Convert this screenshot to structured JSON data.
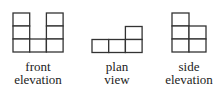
{
  "views": [
    {
      "id": "front",
      "label_line1": "front",
      "label_line2": "elevation",
      "grid": {
        "origin": [
          13,
          13
        ],
        "cell_w": 16.7,
        "cell_h": 13,
        "cells": [
          [
            0,
            0
          ],
          [
            2,
            0
          ],
          [
            0,
            1
          ],
          [
            2,
            1
          ],
          [
            0,
            2
          ],
          [
            1,
            2
          ],
          [
            2,
            2
          ]
        ]
      }
    },
    {
      "id": "plan",
      "label_line1": "plan",
      "label_line2": "view",
      "grid": {
        "origin": [
          92,
          26.5
        ],
        "cell_w": 16.7,
        "cell_h": 13,
        "cells": [
          [
            2,
            0
          ],
          [
            0,
            1
          ],
          [
            1,
            1
          ],
          [
            2,
            1
          ]
        ]
      }
    },
    {
      "id": "side",
      "label_line1": "side",
      "label_line2": "elevation",
      "grid": {
        "origin": [
          172,
          13
        ],
        "cell_w": 17,
        "cell_h": 13,
        "cells": [
          [
            0,
            0
          ],
          [
            0,
            1
          ],
          [
            1,
            1
          ],
          [
            0,
            2
          ],
          [
            1,
            2
          ]
        ]
      }
    }
  ],
  "colors": {
    "line": "#333333",
    "text": "#222222",
    "background": "#ffffff"
  }
}
